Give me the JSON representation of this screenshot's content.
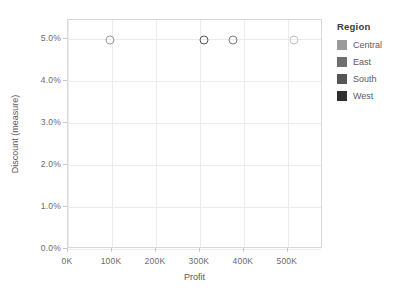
{
  "chart_data": {
    "type": "scatter",
    "title": "",
    "xlabel": "Profit",
    "ylabel": "Discount (measure)",
    "xlim": [
      0,
      580000
    ],
    "ylim": [
      0,
      5.45
    ],
    "grid": true,
    "legend_position": "right",
    "x_ticks": [
      {
        "label": "0K",
        "value": 0
      },
      {
        "label": "100K",
        "value": 100000
      },
      {
        "label": "200K",
        "value": 200000
      },
      {
        "label": "300K",
        "value": 300000
      },
      {
        "label": "400K",
        "value": 400000
      },
      {
        "label": "500K",
        "value": 500000
      }
    ],
    "y_ticks": [
      {
        "label": "0.0%",
        "value": 0
      },
      {
        "label": "1.0%",
        "value": 1
      },
      {
        "label": "2.0%",
        "value": 2
      },
      {
        "label": "3.0%",
        "value": 3
      },
      {
        "label": "4.0%",
        "value": 4
      },
      {
        "label": "5.0%",
        "value": 5
      }
    ],
    "series": [
      {
        "name": "Central",
        "x": 95000,
        "y": 4.98,
        "color": "#9a9a9a"
      },
      {
        "name": "East",
        "x": 310000,
        "y": 4.98,
        "color": "#555555"
      },
      {
        "name": "South",
        "x": 375000,
        "y": 4.98,
        "color": "#7d7d7d"
      },
      {
        "name": "West",
        "x": 515000,
        "y": 4.98,
        "color": "#c2c2c2"
      }
    ]
  },
  "legend": {
    "title": "Region",
    "items": [
      {
        "label": "Central",
        "color": "#9a9a9a"
      },
      {
        "label": "East",
        "color": "#6e6e6e"
      },
      {
        "label": "South",
        "color": "#565656"
      },
      {
        "label": "West",
        "color": "#2f2f2f"
      }
    ]
  }
}
